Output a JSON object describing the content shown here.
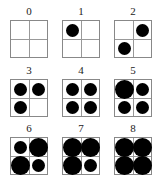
{
  "figure": {
    "panels": [
      {
        "label": "0",
        "x": 10,
        "y": 6,
        "cells": [
          0,
          0,
          0,
          0
        ]
      },
      {
        "label": "1",
        "x": 62,
        "y": 6,
        "cells": [
          2,
          0,
          0,
          0
        ]
      },
      {
        "label": "2",
        "x": 114,
        "y": 6,
        "cells": [
          0,
          2,
          2,
          0
        ]
      },
      {
        "label": "3",
        "x": 10,
        "y": 65,
        "cells": [
          2,
          2,
          2,
          0
        ]
      },
      {
        "label": "4",
        "x": 62,
        "y": 65,
        "cells": [
          2,
          2,
          2,
          2
        ]
      },
      {
        "label": "5",
        "x": 114,
        "y": 65,
        "cells": [
          3,
          2,
          2,
          2
        ]
      },
      {
        "label": "6",
        "x": 10,
        "y": 123,
        "cells": [
          2,
          3,
          3,
          2
        ]
      },
      {
        "label": "7",
        "x": 62,
        "y": 123,
        "cells": [
          3,
          3,
          3,
          2
        ]
      },
      {
        "label": "8",
        "x": 114,
        "y": 123,
        "cells": [
          3,
          3,
          3,
          3
        ]
      }
    ],
    "cell_order": [
      "top-left",
      "top-right",
      "bottom-left",
      "bottom-right"
    ],
    "dot_size_legend": {
      "0": "empty",
      "2": "medium dot",
      "3": "large dot"
    },
    "colors": {
      "dot": "#000000",
      "grid": "#888888"
    }
  }
}
